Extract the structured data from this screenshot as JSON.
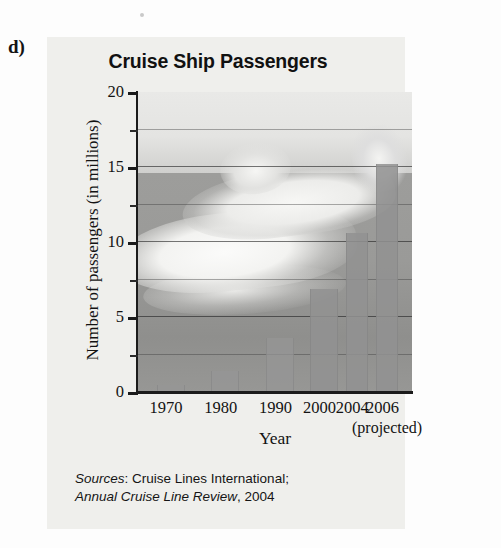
{
  "part_label": "d)",
  "chart_data": {
    "type": "bar",
    "title": "Cruise Ship Passengers",
    "xlabel": "Year",
    "ylabel": "Number of passengers (in millions)",
    "categories": [
      "1970",
      "1980",
      "1990",
      "2000",
      "2004",
      "2006"
    ],
    "values": [
      0.5,
      1.4,
      3.6,
      6.9,
      10.6,
      15.2
    ],
    "ylim": [
      0,
      20
    ],
    "yticks": [
      "0",
      "5",
      "10",
      "15",
      "20"
    ],
    "ytick_values": [
      0,
      5,
      10,
      15,
      20
    ],
    "minor_tick_interval": 2.5,
    "grid": true,
    "grid_axis": "y",
    "legend": "none",
    "annotations": [
      "(projected)"
    ],
    "projected_category": "2006",
    "background_image": "cruise-ship-photo",
    "bar_color": "#969696",
    "plot_background_color": "#9c9c9c"
  },
  "projected_note": "(projected)",
  "sources": {
    "label": "Sources",
    "colon": ":",
    "line1_rest": " Cruise Lines International;",
    "publication": "Annual Cruise Line Review",
    "line2_rest": ", 2004"
  }
}
